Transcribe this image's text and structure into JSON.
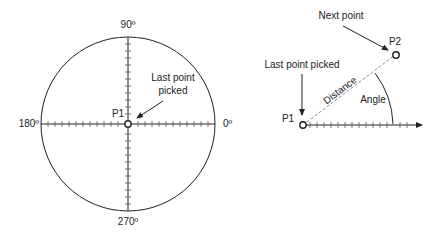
{
  "left_diagram": {
    "title": "Polar angle reference",
    "angle_labels": {
      "top": "90º",
      "left": "180º",
      "right": "0º",
      "bottom": "270º"
    },
    "point_label": "P1",
    "callout_line1": "Last point",
    "callout_line2": "picked"
  },
  "right_diagram": {
    "p1_label": "P1",
    "p2_label": "P2",
    "last_point_label": "Last point picked",
    "next_point_label": "Next point",
    "distance_label": "Distance",
    "angle_label": "Angle"
  },
  "colors": {
    "stroke": "#222222",
    "dashed": "#888888",
    "background": "#ffffff"
  }
}
